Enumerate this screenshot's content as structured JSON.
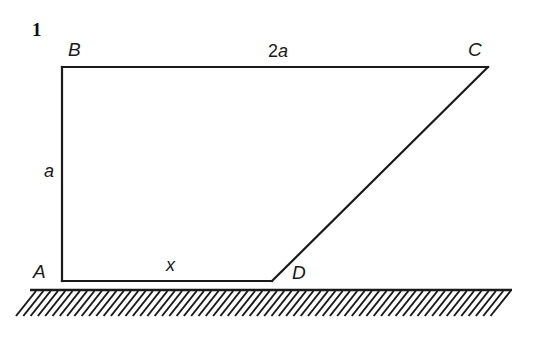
{
  "figure": {
    "number": "1",
    "type": "geometry-diagram",
    "background_color": "#ffffff",
    "stroke_color": "#1a1a1a",
    "vertices": [
      {
        "name": "A",
        "label": "A",
        "x": 62,
        "y": 281,
        "label_x": 33,
        "label_y": 262
      },
      {
        "name": "B",
        "label": "B",
        "x": 62,
        "y": 67,
        "label_x": 68,
        "label_y": 40
      },
      {
        "name": "C",
        "label": "C",
        "x": 488,
        "y": 67,
        "label_x": 468,
        "label_y": 40
      },
      {
        "name": "D",
        "label": "D",
        "x": 272,
        "y": 281,
        "label_x": 292,
        "label_y": 263
      }
    ],
    "edges": [
      {
        "name": "edge-A-B",
        "from": "A",
        "to": "B"
      },
      {
        "name": "edge-B-C",
        "from": "B",
        "to": "C"
      },
      {
        "name": "edge-C-D",
        "from": "C",
        "to": "D"
      },
      {
        "name": "edge-D-A",
        "from": "D",
        "to": "A"
      }
    ],
    "measures": [
      {
        "name": "side-ab-length",
        "text_number": "",
        "text_symbol": "a",
        "x": 44,
        "y": 162
      },
      {
        "name": "side-bc-length",
        "text_number": "2",
        "text_symbol": "a",
        "x": 268,
        "y": 42
      },
      {
        "name": "segment-ad-length",
        "text_number": "",
        "text_symbol": "x",
        "x": 166,
        "y": 256
      }
    ],
    "ground": {
      "name": "ground-line",
      "x_start": 30,
      "x_end": 512,
      "y": 290,
      "hatch_count": 66,
      "hatch_spacing": 7.3,
      "hatch_length": 26,
      "hatch_dx": -20
    }
  }
}
